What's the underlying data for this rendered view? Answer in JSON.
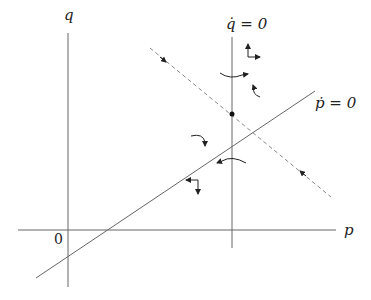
{
  "diagram": {
    "type": "phase-diagram",
    "axes": {
      "x_label": "p",
      "y_label": "q",
      "origin_label": "0"
    },
    "curves": [
      {
        "name": "q-dot-nullcline",
        "label": "q̇ = 0",
        "style": "solid",
        "orientation": "vertical"
      },
      {
        "name": "p-dot-nullcline",
        "label": "ṗ = 0",
        "style": "solid",
        "orientation": "upward-sloping"
      },
      {
        "name": "saddle-path",
        "label": "",
        "style": "dashed",
        "orientation": "downward-sloping"
      }
    ],
    "equilibrium": {
      "marker": "dot"
    },
    "colors": {
      "line": "#555555",
      "dashed": "#8a8a8a",
      "text": "#222222"
    }
  }
}
